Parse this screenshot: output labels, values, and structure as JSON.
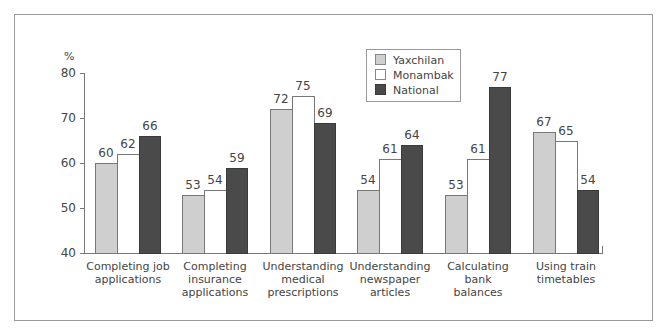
{
  "chart_data": {
    "type": "bar",
    "title": "",
    "xlabel": "",
    "ylabel": "%",
    "ylim": [
      40,
      80
    ],
    "yticks": [
      40,
      50,
      60,
      70,
      80
    ],
    "grid": false,
    "legend_position": "top-center",
    "categories": [
      "Completing job applications",
      "Completing insurance applications",
      "Understanding medical prescriptions",
      "Understanding newspaper articles",
      "Calculating bank balances",
      "Using train timetables"
    ],
    "series": [
      {
        "name": "Yaxchilan",
        "color": "#cfcfcf",
        "values": [
          60,
          53,
          72,
          54,
          53,
          67
        ]
      },
      {
        "name": "Monambak",
        "color": "#ffffff",
        "values": [
          62,
          54,
          75,
          61,
          61,
          65
        ]
      },
      {
        "name": "National",
        "color": "#4a4a4a",
        "values": [
          66,
          59,
          69,
          64,
          77,
          54
        ]
      }
    ]
  },
  "axis": {
    "unit": "%",
    "ticks": [
      "80",
      "70",
      "60",
      "50",
      "40"
    ]
  },
  "legend": {
    "items": [
      "Yaxchilan",
      "Monambak",
      "National"
    ]
  },
  "categories": [
    [
      "Completing job",
      "applications"
    ],
    [
      "Completing",
      "insurance",
      "applications"
    ],
    [
      "Understanding",
      "medical",
      "prescriptions"
    ],
    [
      "Understanding",
      "newspaper",
      "articles"
    ],
    [
      "Calculating",
      "bank",
      "balances"
    ],
    [
      "Using train",
      "timetables"
    ]
  ]
}
